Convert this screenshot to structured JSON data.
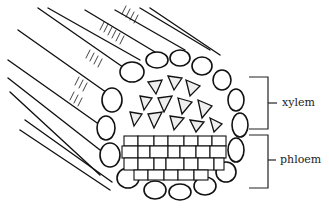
{
  "diagram": {
    "labels": [
      {
        "id": "xylem",
        "text": "xylem"
      },
      {
        "id": "phloem",
        "text": "phloem"
      }
    ],
    "colors": {
      "line": "#111111",
      "background": "#ffffff",
      "cell_fill": "#ffffff",
      "xylem_fill": "#e8e8e8"
    }
  }
}
